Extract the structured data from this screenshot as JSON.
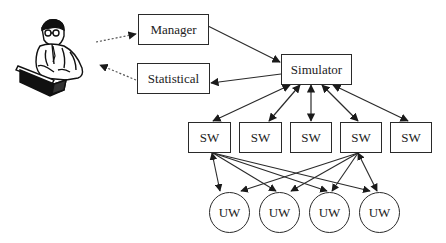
{
  "diagram": {
    "user": {
      "icon": "person-at-laptop-icon"
    },
    "nodes": {
      "manager": "Manager",
      "statistical": "Statistical",
      "simulator": "Simulator",
      "sw": [
        "SW",
        "SW",
        "SW",
        "SW",
        "SW"
      ],
      "uw": [
        "UW",
        "UW",
        "UW",
        "UW"
      ]
    },
    "edges": [
      {
        "from": "user",
        "to": "manager",
        "style": "dotted",
        "direction": "forward"
      },
      {
        "from": "statistical",
        "to": "user",
        "style": "dotted",
        "direction": "forward"
      },
      {
        "from": "manager",
        "to": "simulator",
        "style": "solid",
        "direction": "forward"
      },
      {
        "from": "simulator",
        "to": "statistical",
        "style": "solid",
        "direction": "forward"
      },
      {
        "from": "simulator",
        "to": "sw1",
        "style": "solid",
        "direction": "both"
      },
      {
        "from": "simulator",
        "to": "sw2",
        "style": "solid",
        "direction": "both"
      },
      {
        "from": "simulator",
        "to": "sw3",
        "style": "solid",
        "direction": "both"
      },
      {
        "from": "simulator",
        "to": "sw4",
        "style": "solid",
        "direction": "both"
      },
      {
        "from": "simulator",
        "to": "sw5",
        "style": "solid",
        "direction": "both"
      },
      {
        "from": "sw1",
        "to": "uw1",
        "style": "solid",
        "direction": "both"
      },
      {
        "from": "sw1",
        "to": "uw2",
        "style": "solid",
        "direction": "both"
      },
      {
        "from": "sw1",
        "to": "uw3",
        "style": "solid",
        "direction": "both"
      },
      {
        "from": "sw1",
        "to": "uw4",
        "style": "solid",
        "direction": "both"
      },
      {
        "from": "sw4",
        "to": "uw1",
        "style": "solid",
        "direction": "both"
      },
      {
        "from": "sw4",
        "to": "uw2",
        "style": "solid",
        "direction": "both"
      },
      {
        "from": "sw4",
        "to": "uw3",
        "style": "solid",
        "direction": "both"
      },
      {
        "from": "sw4",
        "to": "uw4",
        "style": "solid",
        "direction": "both"
      }
    ],
    "colors": {
      "stroke": "#2a2a2a",
      "background": "#ffffff"
    }
  }
}
